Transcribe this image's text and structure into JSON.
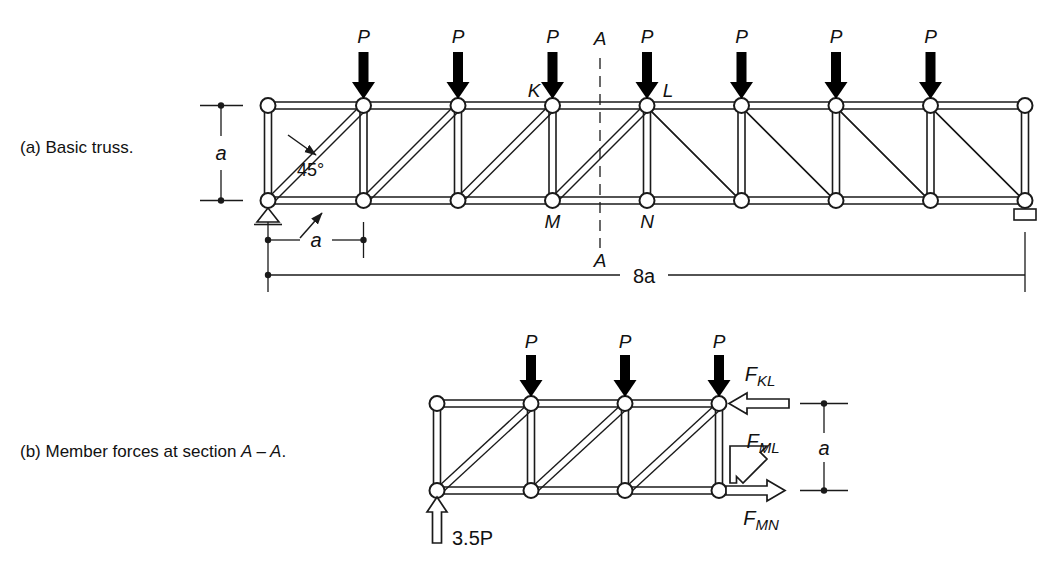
{
  "figure": {
    "title_a": "(a) Basic truss.",
    "title_b_prefix": "(b) Member forces at section ",
    "title_b_section": "A – A",
    "title_b_suffix": "."
  },
  "part_a": {
    "caption": "(a) Basic truss.",
    "panels": 8,
    "panel_width_label": "a",
    "height_label": "a",
    "span_label": "8a",
    "angle_label": "45°",
    "section_label_top": "A",
    "section_label_bottom": "A",
    "load_label": "P",
    "loads": [
      "P",
      "P",
      "P",
      "P",
      "P",
      "P",
      "P"
    ],
    "node_labels": {
      "top_left": "K",
      "top_right": "L",
      "bottom_left": "M",
      "bottom_right": "N"
    },
    "supports": {
      "left": "pin-support",
      "right": "roller-support"
    }
  },
  "part_b": {
    "caption": "(b) Member forces at section A – A.",
    "panels": 3,
    "loads": [
      "P",
      "P",
      "P"
    ],
    "reaction_label": "3.5P",
    "height_label": "a",
    "forces": [
      {
        "name": "F_KL",
        "base": "F",
        "sub": "KL",
        "direction": "left"
      },
      {
        "name": "F_ML",
        "base": "F",
        "sub": "ML",
        "direction": "down-left"
      },
      {
        "name": "F_MN",
        "base": "F",
        "sub": "MN",
        "direction": "right"
      }
    ]
  },
  "colors": {
    "line": "#1a1a1a",
    "fill": "#ffffff",
    "load_arrow": "#000000",
    "background": "#ffffff"
  }
}
